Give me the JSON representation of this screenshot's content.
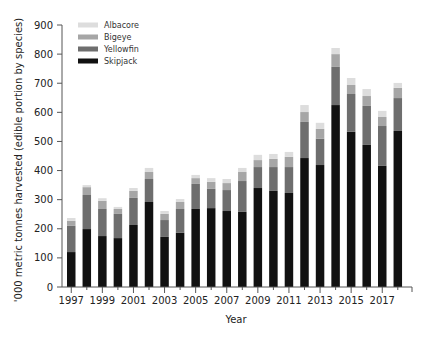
{
  "chart_data": {
    "type": "bar",
    "stacked": true,
    "title": "",
    "xlabel": "Year",
    "ylabel": "'000 metric tonnes harvested  (edible portion by species)",
    "ylim": [
      0,
      900
    ],
    "yticks": [
      0,
      100,
      200,
      300,
      400,
      500,
      600,
      700,
      800,
      900
    ],
    "xtick_labels": [
      "1997",
      "1999",
      "2001",
      "2003",
      "2005",
      "2007",
      "2009",
      "2011",
      "2013",
      "2015",
      "2017"
    ],
    "grid": false,
    "legend_position": "upper-left",
    "categories": [
      "1997",
      "1998",
      "1999",
      "2000",
      "2001",
      "2002",
      "2003",
      "2004",
      "2005",
      "2006",
      "2007",
      "2008",
      "2009",
      "2010",
      "2011",
      "2012",
      "2013",
      "2014",
      "2015",
      "2016",
      "2017",
      "2018"
    ],
    "series": [
      {
        "name": "Skipjack",
        "color": "#111111",
        "values": [
          120,
          199,
          175,
          168,
          213,
          292,
          172,
          186,
          268,
          271,
          261,
          258,
          340,
          330,
          323,
          443,
          419,
          625,
          533,
          488,
          416,
          536
        ]
      },
      {
        "name": "Yellowfin",
        "color": "#6e6e6e",
        "values": [
          90,
          117,
          93,
          83,
          93,
          79,
          58,
          82,
          86,
          66,
          72,
          106,
          72,
          82,
          89,
          124,
          90,
          131,
          130,
          134,
          137,
          113
        ]
      },
      {
        "name": "Bigeye",
        "color": "#a6a6a6",
        "values": [
          17,
          27,
          28,
          17,
          24,
          24,
          21,
          24,
          20,
          24,
          24,
          31,
          24,
          28,
          35,
          34,
          34,
          44,
          31,
          34,
          31,
          35
        ]
      },
      {
        "name": "Albacore",
        "color": "#dddddd",
        "values": [
          10,
          7,
          9,
          7,
          10,
          14,
          10,
          10,
          11,
          13,
          14,
          14,
          18,
          17,
          17,
          24,
          21,
          21,
          24,
          24,
          21,
          17
        ]
      }
    ],
    "legend_order": [
      "Albacore",
      "Bigeye",
      "Yellowfin",
      "Skipjack"
    ]
  }
}
